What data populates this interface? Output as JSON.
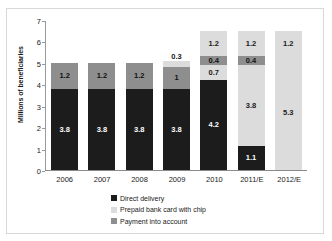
{
  "chart_data": {
    "type": "bar",
    "subtype": "stacked-bar",
    "title": "",
    "xlabel": "",
    "ylabel": "Millions of beneficiaries",
    "ylim": [
      0,
      7
    ],
    "yticks": [
      0,
      1,
      2,
      3,
      4,
      5,
      6,
      7
    ],
    "grid": false,
    "legend_position": "bottom-center",
    "categories": [
      "2006",
      "2007",
      "2008",
      "2009",
      "2010",
      "2011/E",
      "2012/E"
    ],
    "series": [
      {
        "name": "Direct delivery",
        "color": "#1c1c1c",
        "values": [
          3.8,
          3.8,
          3.8,
          3.8,
          4.2,
          1.1,
          0
        ]
      },
      {
        "name": "Prepaid bank card with chip",
        "color": "#dcdcdc",
        "values": [
          0,
          0,
          0,
          0.3,
          0.7,
          3.8,
          5.3
        ]
      },
      {
        "name": "Payment into account",
        "color": "#8e8e8e",
        "values": [
          1.2,
          1.2,
          1.2,
          1.0,
          0.4,
          0.4,
          0.4
        ]
      },
      {
        "name": "Payment into account (top)",
        "color": "#dcdcdc",
        "values": [
          0,
          0,
          0,
          0,
          1.2,
          1.2,
          1.2
        ]
      }
    ],
    "totals": [
      5.0,
      5.0,
      5.0,
      5.1,
      6.5,
      6.5,
      6.5
    ],
    "annotations": [
      "0.3 label sits above the 2009 bar",
      "2006-2008 identical: 3.8 direct + 1.2 account"
    ]
  },
  "axis": {
    "y_title": "Millions of beneficiaries",
    "y_ticks": [
      "7",
      "6",
      "5",
      "4",
      "3",
      "2",
      "1",
      "0"
    ],
    "x_ticks": [
      "2006",
      "2007",
      "2008",
      "2009",
      "2010",
      "2011/E",
      "2012/E"
    ]
  },
  "bars": [
    {
      "category": "2006",
      "segments": [
        {
          "series": "direct",
          "value": 3.8,
          "label": "3.8",
          "outside": false
        },
        {
          "series": "account",
          "value": 1.2,
          "label": "1.2",
          "outside": false
        }
      ]
    },
    {
      "category": "2007",
      "segments": [
        {
          "series": "direct",
          "value": 3.8,
          "label": "3.8",
          "outside": false
        },
        {
          "series": "account",
          "value": 1.2,
          "label": "1.2",
          "outside": false
        }
      ]
    },
    {
      "category": "2008",
      "segments": [
        {
          "series": "direct",
          "value": 3.8,
          "label": "3.8",
          "outside": false
        },
        {
          "series": "account",
          "value": 1.2,
          "label": "1.2",
          "outside": false
        }
      ]
    },
    {
      "category": "2009",
      "segments": [
        {
          "series": "direct",
          "value": 3.8,
          "label": "3.8",
          "outside": false
        },
        {
          "series": "account",
          "value": 1.0,
          "label": "1",
          "outside": false
        },
        {
          "series": "prepaid",
          "value": 0.3,
          "label": "0.3",
          "outside": true
        }
      ]
    },
    {
      "category": "2010",
      "segments": [
        {
          "series": "direct",
          "value": 4.2,
          "label": "4.2",
          "outside": false
        },
        {
          "series": "prepaid",
          "value": 0.7,
          "label": "0.7",
          "outside": false
        },
        {
          "series": "account",
          "value": 0.4,
          "label": "0.4",
          "outside": false
        },
        {
          "series": "prepaid",
          "value": 1.2,
          "label": "1.2",
          "outside": false
        }
      ]
    },
    {
      "category": "2011/E",
      "segments": [
        {
          "series": "direct",
          "value": 1.1,
          "label": "1.1",
          "outside": false
        },
        {
          "series": "prepaid",
          "value": 3.8,
          "label": "3.8",
          "outside": false
        },
        {
          "series": "account",
          "value": 0.4,
          "label": "0.4",
          "outside": false
        },
        {
          "series": "prepaid",
          "value": 1.2,
          "label": "1.2",
          "outside": false
        }
      ]
    },
    {
      "category": "2012/E",
      "segments": [
        {
          "series": "prepaid",
          "value": 5.3,
          "label": "5.3",
          "outside": false
        },
        {
          "series": "prepaid",
          "value": 1.2,
          "label": "1.2",
          "outside": false
        }
      ]
    }
  ],
  "legend": {
    "items": [
      {
        "label": "Direct delivery",
        "series": "direct",
        "color": "#1c1c1c"
      },
      {
        "label": "Prepaid bank card with chip",
        "series": "prepaid",
        "color": "#dcdcdc"
      },
      {
        "label": "Payment into account",
        "series": "account",
        "color": "#8e8e8e"
      }
    ]
  },
  "colors": {
    "direct": "#1c1c1c",
    "prepaid": "#dcdcdc",
    "account": "#8e8e8e",
    "axis": "#8a8a8a",
    "border": "#d8d8d8",
    "text": "#1a1a1a"
  }
}
